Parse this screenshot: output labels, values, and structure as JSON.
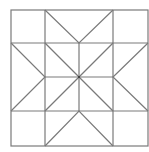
{
  "diagram": {
    "type": "quilt-block",
    "stroke_color": "#7a7a7a",
    "background": "#ffffff",
    "outer_square": {
      "x1": 11,
      "y1": 10,
      "x2": 148,
      "y2": 146
    },
    "grid_x": [
      11,
      45,
      79,
      113,
      148
    ],
    "grid_y": [
      10,
      43,
      77,
      111,
      146
    ],
    "center": [
      79,
      77
    ]
  }
}
